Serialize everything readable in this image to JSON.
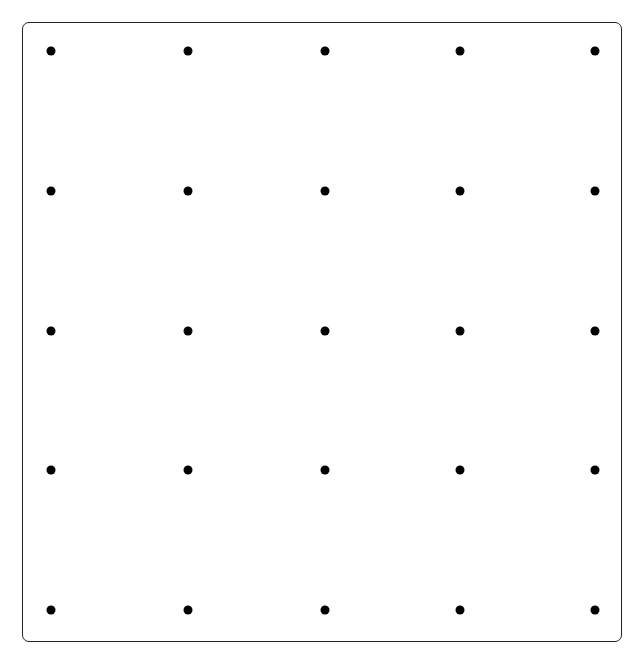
{
  "diagram": {
    "type": "dot-grid",
    "rows": 5,
    "columns": 5,
    "dot_color": "#000000",
    "border_color": "#222222",
    "background": "#ffffff",
    "column_positions": [
      51,
      188,
      325,
      460,
      595
    ],
    "row_positions": [
      51,
      191,
      331,
      470,
      610
    ]
  }
}
